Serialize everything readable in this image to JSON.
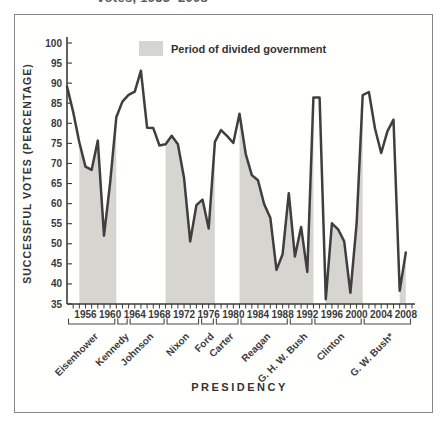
{
  "figure": {
    "cropped_title": "votes, 1953–2008",
    "legend_label": "Period of divided government",
    "x_axis_title": "PRESIDENCY",
    "y_axis_title": "SUCCESSFUL VOTES (PERCENTAGE)"
  },
  "colors": {
    "line": "#3f3f3f",
    "divided_band_fill": "#d7d5d0",
    "axis": "#3a3a3a",
    "frame_border": "#868686",
    "text": "#3a3a3a"
  },
  "chart_data": {
    "type": "line",
    "xlabel": "PRESIDENCY",
    "ylabel": "SUCCESSFUL VOTES (PERCENTAGE)",
    "ylim": [
      35,
      100
    ],
    "xlim": [
      1953,
      2009
    ],
    "grid": false,
    "legend_position": "top-center-inside",
    "legend": [
      {
        "label": "Period of divided government",
        "swatch": "#d7d5d0"
      }
    ],
    "y_ticks": [
      100,
      95,
      90,
      85,
      80,
      75,
      70,
      65,
      60,
      55,
      50,
      45,
      40,
      35
    ],
    "x_tick_labels": [
      1956,
      1960,
      1964,
      1968,
      1972,
      1976,
      1980,
      1984,
      1988,
      1992,
      1996,
      2000,
      2004,
      2008
    ],
    "years": [
      1953,
      1954,
      1955,
      1956,
      1957,
      1958,
      1959,
      1960,
      1961,
      1962,
      1963,
      1964,
      1965,
      1966,
      1967,
      1968,
      1969,
      1970,
      1971,
      1972,
      1973,
      1974,
      1975,
      1976,
      1977,
      1978,
      1979,
      1980,
      1981,
      1982,
      1983,
      1984,
      1985,
      1986,
      1987,
      1988,
      1989,
      1990,
      1991,
      1992,
      1993,
      1994,
      1995,
      1996,
      1997,
      1998,
      1999,
      2000,
      2001,
      2002,
      2003,
      2004,
      2005,
      2006,
      2007,
      2008
    ],
    "values": [
      89.2,
      82.8,
      75.3,
      69.2,
      68.4,
      75.7,
      52.0,
      65.1,
      81.5,
      85.4,
      87.1,
      87.9,
      93.1,
      78.9,
      78.8,
      74.5,
      74.8,
      76.9,
      74.8,
      66.3,
      50.6,
      59.6,
      61.0,
      53.8,
      75.4,
      78.3,
      76.8,
      75.1,
      82.4,
      72.4,
      67.1,
      65.8,
      59.9,
      56.5,
      43.5,
      47.4,
      62.6,
      46.8,
      54.2,
      43.0,
      86.4,
      86.4,
      36.2,
      55.1,
      53.6,
      50.6,
      37.8,
      55.0,
      87.0,
      87.8,
      78.7,
      72.6,
      78.0,
      80.9,
      38.3,
      47.8
    ],
    "divided_government_bands": [
      [
        1955,
        1961
      ],
      [
        1969,
        1977
      ],
      [
        1981,
        1993
      ],
      [
        1995,
        2001
      ],
      [
        2007,
        2009
      ]
    ],
    "presidents": [
      {
        "name": "Eisenhower",
        "start": 1953,
        "end": 1961
      },
      {
        "name": "Kennedy",
        "start": 1961,
        "end": 1963
      },
      {
        "name": "Johnson",
        "start": 1963,
        "end": 1969
      },
      {
        "name": "Nixon",
        "start": 1969,
        "end": 1974.6
      },
      {
        "name": "Ford",
        "start": 1974.6,
        "end": 1977
      },
      {
        "name": "Carter",
        "start": 1977,
        "end": 1981
      },
      {
        "name": "Reagan",
        "start": 1981,
        "end": 1989
      },
      {
        "name": "G. H. W. Bush",
        "start": 1989,
        "end": 1993
      },
      {
        "name": "Clinton",
        "start": 1993,
        "end": 2001
      },
      {
        "name": "G. W. Bush*",
        "start": 2001,
        "end": 2009
      }
    ]
  }
}
